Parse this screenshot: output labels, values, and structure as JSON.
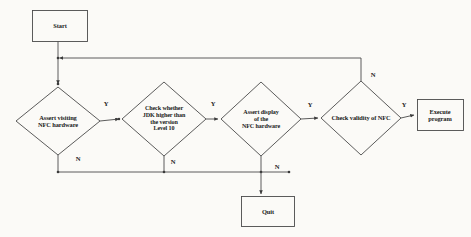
{
  "diagram": {
    "type": "flowchart",
    "background_color": "#fbfaf7",
    "line_color": "#4a4a4a",
    "text_color": "#1a1a1a"
  },
  "nodes": {
    "start": {
      "label": "Start",
      "shape": "rectangle",
      "x": 60,
      "y": 26,
      "w": 55,
      "h": 31
    },
    "assert_visiting": {
      "label": "Assert visiting\nNFC hardware",
      "shape": "diamond",
      "x": 58,
      "y": 121,
      "w": 84,
      "h": 68
    },
    "check_jdk": {
      "label": "Check whether\nJDK higher than\nthe version\nLevel 10",
      "shape": "diamond",
      "x": 164,
      "y": 119,
      "w": 84,
      "h": 74
    },
    "assert_display": {
      "label": "Assert display\nof  the\nNFC hardware",
      "shape": "diamond",
      "x": 261,
      "y": 119,
      "w": 80,
      "h": 74
    },
    "check_validity": {
      "label": "Check  validity of NFC",
      "shape": "diamond",
      "x": 361,
      "y": 118,
      "w": 80,
      "h": 74
    },
    "execute": {
      "label": "Execute\nprogram",
      "shape": "rectangle",
      "x": 440,
      "y": 115,
      "w": 46,
      "h": 31
    },
    "quit": {
      "label": "Quit",
      "shape": "rectangle",
      "x": 268,
      "y": 212,
      "w": 53,
      "h": 30
    }
  },
  "branch_labels": [
    {
      "name": "yes-assert-visiting",
      "text": "Y",
      "x": 106,
      "y": 104
    },
    {
      "name": "yes-check-jdk",
      "text": "Y",
      "x": 213,
      "y": 104
    },
    {
      "name": "yes-assert-display",
      "text": "Y",
      "x": 310,
      "y": 105
    },
    {
      "name": "yes-check-validity",
      "text": "Y",
      "x": 404,
      "y": 105
    },
    {
      "name": "no-assert-visiting",
      "text": "N",
      "x": 78,
      "y": 159
    },
    {
      "name": "no-check-jdk",
      "text": "N",
      "x": 173,
      "y": 162
    },
    {
      "name": "no-assert-display",
      "text": "N",
      "x": 277,
      "y": 167
    },
    {
      "name": "no-check-validity",
      "text": "N",
      "x": 373,
      "y": 75
    }
  ],
  "edges": [
    {
      "from": "start",
      "to": "assert_visiting",
      "label": ""
    },
    {
      "from": "assert_visiting",
      "to": "check_jdk",
      "label": "Y"
    },
    {
      "from": "check_jdk",
      "to": "assert_display",
      "label": "Y"
    },
    {
      "from": "assert_display",
      "to": "check_validity",
      "label": "Y"
    },
    {
      "from": "check_validity",
      "to": "execute",
      "label": "Y"
    },
    {
      "from": "assert_visiting",
      "to": "quit",
      "label": "N"
    },
    {
      "from": "check_jdk",
      "to": "quit",
      "label": "N"
    },
    {
      "from": "assert_display",
      "to": "quit",
      "label": "N"
    },
    {
      "from": "check_validity",
      "to": "assert_visiting",
      "label": "N"
    }
  ]
}
